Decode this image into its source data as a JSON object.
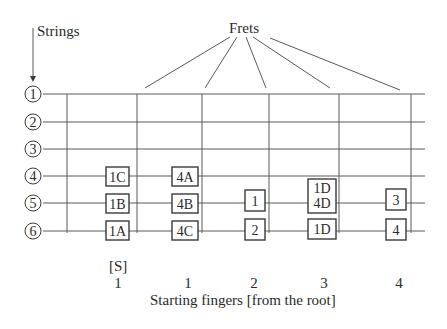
{
  "labels": {
    "strings": "Strings",
    "frets": "Frets",
    "caption": "Starting fingers [from the root]",
    "s_marker": "[S]"
  },
  "strings": [
    {
      "label": "1",
      "y": 94
    },
    {
      "label": "2",
      "y": 122
    },
    {
      "label": "3",
      "y": 149
    },
    {
      "label": "4",
      "y": 176
    },
    {
      "label": "5",
      "y": 203
    },
    {
      "label": "6",
      "y": 231
    }
  ],
  "frets_x": [
    67,
    137,
    202,
    269,
    339,
    411
  ],
  "boxes": [
    {
      "text": "1C",
      "x": 106,
      "y": 167,
      "w": 23,
      "h": 19
    },
    {
      "text": "1B",
      "x": 106,
      "y": 194,
      "w": 23,
      "h": 19
    },
    {
      "text": "1A",
      "x": 106,
      "y": 221,
      "w": 23,
      "h": 19
    },
    {
      "text": "4A",
      "x": 172,
      "y": 167,
      "w": 26,
      "h": 19
    },
    {
      "text": "4B",
      "x": 172,
      "y": 194,
      "w": 26,
      "h": 19
    },
    {
      "text": "4C",
      "x": 172,
      "y": 221,
      "w": 26,
      "h": 19
    },
    {
      "text": "1",
      "x": 245,
      "y": 190,
      "w": 20,
      "h": 21
    },
    {
      "text": "2",
      "x": 245,
      "y": 219,
      "w": 20,
      "h": 21
    },
    {
      "text": "1D\n4D",
      "x": 308,
      "y": 179,
      "w": 28,
      "h": 34
    },
    {
      "text": "1D",
      "x": 308,
      "y": 219,
      "w": 28,
      "h": 20
    },
    {
      "text": "3",
      "x": 386,
      "y": 189,
      "w": 20,
      "h": 21
    },
    {
      "text": "4",
      "x": 386,
      "y": 219,
      "w": 20,
      "h": 21
    }
  ],
  "finger_numbers": [
    {
      "label": "1",
      "x": 118
    },
    {
      "label": "1",
      "x": 188
    },
    {
      "label": "2",
      "x": 254
    },
    {
      "label": "3",
      "x": 324
    },
    {
      "label": "4",
      "x": 399
    }
  ],
  "colors": {
    "line": "#5a5a5a",
    "text": "#2a2a2a"
  }
}
